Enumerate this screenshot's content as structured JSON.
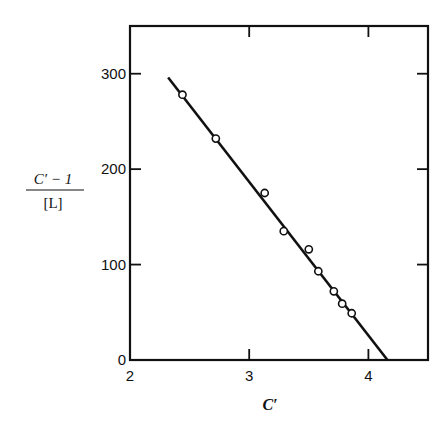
{
  "chart_data": {
    "type": "scatter",
    "title": "",
    "xlabel": "C′",
    "ylabel": {
      "numerator": "C′ − 1",
      "denominator": "[L]"
    },
    "xlim": [
      2,
      4.5
    ],
    "ylim": [
      0,
      350
    ],
    "xticks": [
      2,
      3,
      4
    ],
    "yticks": [
      0,
      100,
      200,
      300
    ],
    "xtick_labels": [
      "2",
      "3",
      "4"
    ],
    "ytick_labels": [
      "0",
      "100",
      "200",
      "300"
    ],
    "grid": false,
    "legend": null,
    "series": [
      {
        "name": "data",
        "marker": "open-circle",
        "x": [
          2.44,
          2.72,
          3.13,
          3.29,
          3.5,
          3.58,
          3.71,
          3.78,
          3.86
        ],
        "y": [
          278,
          232,
          175,
          135,
          116,
          93,
          72,
          59,
          49
        ]
      },
      {
        "name": "fit",
        "style": "line",
        "x": [
          2.32,
          4.16
        ],
        "y": [
          296,
          0
        ]
      }
    ]
  },
  "colors": {
    "ink": "#111111",
    "background": "#ffffff"
  }
}
